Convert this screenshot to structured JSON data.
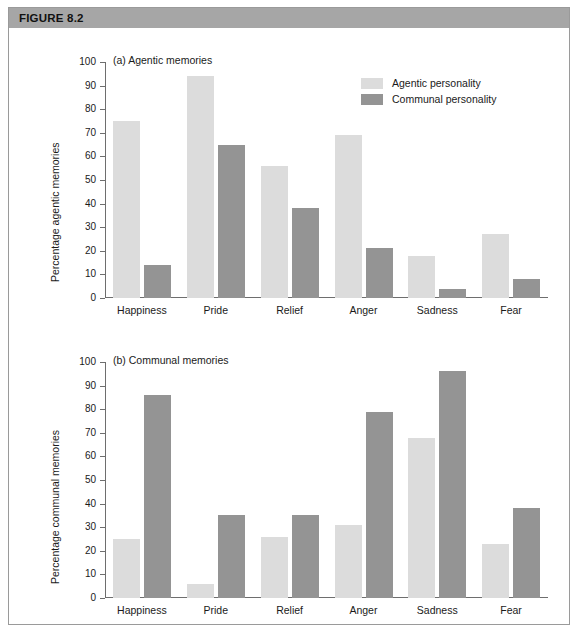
{
  "figure": {
    "header_label": "FIGURE 8.2"
  },
  "legend": {
    "position": "top-right",
    "items": [
      {
        "label": "Agentic personality",
        "color": "#dcdcdc",
        "key": "agentic"
      },
      {
        "label": "Communal personality",
        "color": "#949494",
        "key": "communal"
      }
    ]
  },
  "chart_data": [
    {
      "type": "bar",
      "title": "(a) Agentic memories",
      "xlabel": "",
      "ylabel": "Percentage agentic memories",
      "ylim": [
        0,
        100
      ],
      "ytick_step": 10,
      "yticks": [
        0,
        10,
        20,
        30,
        40,
        50,
        60,
        70,
        80,
        90,
        100
      ],
      "grid": false,
      "legend": [
        "Agentic personality",
        "Communal personality"
      ],
      "categories": [
        "Happiness",
        "Pride",
        "Relief",
        "Anger",
        "Sadness",
        "Fear"
      ],
      "series": [
        {
          "name": "Agentic personality",
          "color": "#dcdcdc",
          "values": [
            75,
            94,
            56,
            69,
            18,
            27
          ]
        },
        {
          "name": "Communal personality",
          "color": "#949494",
          "values": [
            14,
            65,
            38,
            21,
            4,
            8
          ]
        }
      ]
    },
    {
      "type": "bar",
      "title": "(b) Communal memories",
      "xlabel": "",
      "ylabel": "Percentage communal memories",
      "ylim": [
        0,
        100
      ],
      "ytick_step": 10,
      "yticks": [
        0,
        10,
        20,
        30,
        40,
        50,
        60,
        70,
        80,
        90,
        100
      ],
      "grid": false,
      "legend": [
        "Agentic personality",
        "Communal personality"
      ],
      "categories": [
        "Happiness",
        "Pride",
        "Relief",
        "Anger",
        "Sadness",
        "Fear"
      ],
      "series": [
        {
          "name": "Agentic personality",
          "color": "#dcdcdc",
          "values": [
            25,
            6,
            26,
            31,
            68,
            23
          ]
        },
        {
          "name": "Communal personality",
          "color": "#949494",
          "values": [
            86,
            35,
            35,
            79,
            96,
            38
          ]
        }
      ]
    }
  ]
}
